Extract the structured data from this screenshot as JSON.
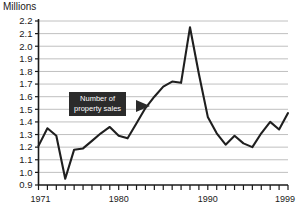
{
  "chart_data": {
    "type": "line",
    "title": "",
    "ylabel": "Millions",
    "xlabel": "",
    "ylim": [
      0.9,
      2.2
    ],
    "xlim": [
      1971,
      1999
    ],
    "grid": true,
    "legend": "none",
    "ytick_labels": [
      "2.2",
      "2.1",
      "2.0",
      "1.9",
      "1.8",
      "1.7",
      "1.6",
      "1.5",
      "1.4",
      "1.3",
      "1.2",
      "1.1",
      "1.0",
      "0.9"
    ],
    "xtick_labels": [
      "1971",
      "1980",
      "1990",
      "1999"
    ],
    "xtick_label_years": [
      1971,
      1980,
      1990,
      1999
    ],
    "annotation": {
      "line1": "Number of",
      "line2": "property sales",
      "points_to_series": true
    },
    "series": [
      {
        "name": "Number of property sales",
        "color": "#1f1f1f",
        "x": [
          1971,
          1972,
          1973,
          1974,
          1975,
          1976,
          1977,
          1978,
          1979,
          1980,
          1981,
          1982,
          1983,
          1984,
          1985,
          1986,
          1987,
          1988,
          1989,
          1990,
          1991,
          1992,
          1993,
          1994,
          1995,
          1996,
          1997,
          1998,
          1999
        ],
        "values": [
          1.21,
          1.35,
          1.29,
          0.95,
          1.18,
          1.19,
          1.25,
          1.31,
          1.36,
          1.29,
          1.27,
          1.39,
          1.51,
          1.6,
          1.68,
          1.72,
          1.71,
          2.15,
          1.78,
          1.44,
          1.31,
          1.22,
          1.29,
          1.23,
          1.2,
          1.31,
          1.4,
          1.34,
          1.47
        ]
      }
    ]
  },
  "axes": {
    "y_title": "Millions"
  }
}
